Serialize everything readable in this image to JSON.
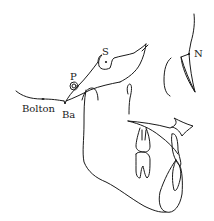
{
  "diagram": {
    "type": "cephalometric-tracing",
    "labels": {
      "sella": "S",
      "nasion": "N",
      "porion": "P",
      "bolton": "Bolton",
      "basion": "Ba"
    },
    "colors": {
      "line": "#1a1a1a",
      "background": "#ffffff"
    }
  }
}
